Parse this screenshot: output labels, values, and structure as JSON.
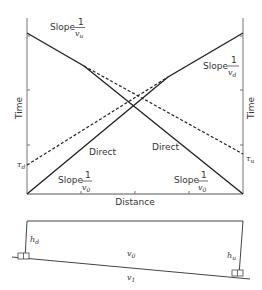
{
  "diagram": {
    "colors": {
      "line": "#222222",
      "axis": "#777777",
      "text": "#333333"
    }
  },
  "graph": {
    "xlabel": "Distance",
    "ylabel_left": "Time",
    "ylabel_right": "Time",
    "labels": {
      "slope_word": "Slope",
      "one": "1",
      "v_u": "v",
      "v_u_sub": "u",
      "v_d": "v",
      "v_d_sub": "d",
      "v_0": "v",
      "v_0_sub": "0",
      "direct_left": "Direct",
      "direct_right": "Direct",
      "tau_d": "τ",
      "tau_d_sub": "d",
      "tau_u": "τ",
      "tau_u_sub": "u"
    }
  },
  "section": {
    "h_d": "h",
    "h_d_sub": "d",
    "h_u": "h",
    "h_u_sub": "u",
    "v0": "v",
    "v0_sub": "0",
    "v1": "v",
    "v1_sub": "1"
  }
}
